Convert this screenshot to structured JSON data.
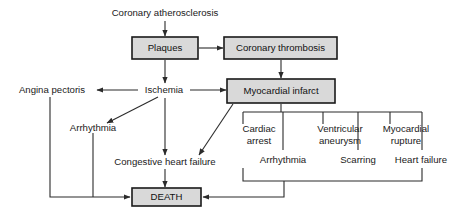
{
  "figure": {
    "background_color": "#ffffff",
    "line_color": "#2b2b2b",
    "box_fill_color": "#d9d9d9",
    "box_border_color": "#1a1a1a",
    "text_color": "#1a1a1a"
  },
  "nodes": {
    "coronary_atherosclerosis": {
      "label": "Coronary atherosclerosis",
      "style": "plain"
    },
    "plaques": {
      "label": "Plaques",
      "style": "box"
    },
    "coronary_thrombosis": {
      "label": "Coronary thrombosis",
      "style": "box"
    },
    "myocardial_infarct": {
      "label": "Myocardial infarct",
      "style": "box"
    },
    "ischemia": {
      "label": "Ischemia",
      "style": "plain"
    },
    "angina_pectoris": {
      "label": "Angina pectoris",
      "style": "plain"
    },
    "arrhythmia_left": {
      "label": "Arrhythmia",
      "style": "plain"
    },
    "congestive_heart_failure": {
      "label": "Congestive heart failure",
      "style": "plain"
    },
    "cardiac_arrest_line1": {
      "label": "Cardiac",
      "style": "plain"
    },
    "cardiac_arrest_line2": {
      "label": "arrest",
      "style": "plain"
    },
    "ventricular_aneurysm_line1": {
      "label": "Ventricular",
      "style": "plain"
    },
    "ventricular_aneurysm_line2": {
      "label": "aneurysm",
      "style": "plain"
    },
    "myocardial_rupture_line1": {
      "label": "Myocardial",
      "style": "plain"
    },
    "myocardial_rupture_line2": {
      "label": "rupture",
      "style": "plain"
    },
    "arrhythmia_right": {
      "label": "Arrhythmia",
      "style": "plain"
    },
    "scarring": {
      "label": "Scarring",
      "style": "plain"
    },
    "heart_failure": {
      "label": "Heart failure",
      "style": "plain"
    },
    "death": {
      "label": "DEATH",
      "style": "box"
    }
  }
}
